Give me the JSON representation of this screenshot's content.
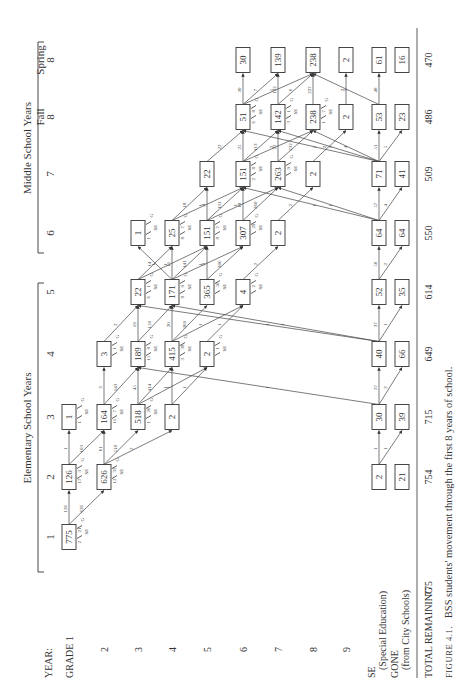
{
  "headers": {
    "year_label": "YEAR:",
    "elementary": "Elementary School Years",
    "middle": "Middle School Years",
    "years": [
      {
        "id": "y1",
        "label": "1"
      },
      {
        "id": "y2",
        "label": "2"
      },
      {
        "id": "y3",
        "label": "3"
      },
      {
        "id": "y4",
        "label": "4"
      },
      {
        "id": "y5",
        "label": "5"
      },
      {
        "id": "y6",
        "label": "6"
      },
      {
        "id": "y7",
        "label": "7"
      },
      {
        "id": "f8",
        "label": "8",
        "sub": "Fall"
      },
      {
        "id": "s8",
        "label": "8",
        "sub": "Spring"
      }
    ]
  },
  "rows": [
    {
      "id": "g1",
      "label": "GRADE 1"
    },
    {
      "id": "g2",
      "label": "2"
    },
    {
      "id": "g3",
      "label": "3"
    },
    {
      "id": "g4",
      "label": "4"
    },
    {
      "id": "g5",
      "label": "5"
    },
    {
      "id": "g6",
      "label": "6"
    },
    {
      "id": "g7",
      "label": "7"
    },
    {
      "id": "g8",
      "label": "8"
    },
    {
      "id": "g9",
      "label": "9"
    },
    {
      "id": "se",
      "label": "SE",
      "sub": "(Special Education)"
    },
    {
      "id": "gone",
      "label": "GONE",
      "sub": "(from City Schools)"
    }
  ],
  "totals": {
    "label": "TOTAL REMAINING",
    "values": [
      "775",
      "754",
      "715",
      "649",
      "614",
      "550",
      "509",
      "486",
      "470"
    ]
  },
  "caption": {
    "prefix": "FIGURE 4.1.",
    "text": "BSS students' movement through the first 8 years of school."
  },
  "boxes": [
    {
      "col": "y1",
      "row": "g1",
      "v": "775"
    },
    {
      "col": "y2",
      "row": "g1",
      "v": "126"
    },
    {
      "col": "y2",
      "row": "g2",
      "v": "626"
    },
    {
      "col": "y2",
      "row": "se",
      "v": "2"
    },
    {
      "col": "y2",
      "row": "gone",
      "v": "21"
    },
    {
      "col": "y3",
      "row": "g1",
      "v": "1"
    },
    {
      "col": "y3",
      "row": "g2",
      "v": "164"
    },
    {
      "col": "y3",
      "row": "g3",
      "v": "518"
    },
    {
      "col": "y3",
      "row": "g4",
      "v": "2"
    },
    {
      "col": "y3",
      "row": "se",
      "v": "30"
    },
    {
      "col": "y3",
      "row": "gone",
      "v": "39"
    },
    {
      "col": "y4",
      "row": "g2",
      "v": "3"
    },
    {
      "col": "y4",
      "row": "g3",
      "v": "189"
    },
    {
      "col": "y4",
      "row": "g4",
      "v": "415"
    },
    {
      "col": "y4",
      "row": "g5",
      "v": "2"
    },
    {
      "col": "y4",
      "row": "se",
      "v": "40"
    },
    {
      "col": "y4",
      "row": "gone",
      "v": "66"
    },
    {
      "col": "y5",
      "row": "g3",
      "v": "22"
    },
    {
      "col": "y5",
      "row": "g4",
      "v": "171"
    },
    {
      "col": "y5",
      "row": "g5",
      "v": "365"
    },
    {
      "col": "y5",
      "row": "g6",
      "v": "4"
    },
    {
      "col": "y5",
      "row": "se",
      "v": "52"
    },
    {
      "col": "y5",
      "row": "gone",
      "v": "35"
    },
    {
      "col": "y6",
      "row": "g3",
      "v": "1"
    },
    {
      "col": "y6",
      "row": "g4",
      "v": "25"
    },
    {
      "col": "y6",
      "row": "g5",
      "v": "151"
    },
    {
      "col": "y6",
      "row": "g6",
      "v": "307"
    },
    {
      "col": "y6",
      "row": "g7",
      "v": "2"
    },
    {
      "col": "y6",
      "row": "se",
      "v": "64"
    },
    {
      "col": "y6",
      "row": "gone",
      "v": "64"
    },
    {
      "col": "y7",
      "row": "g5",
      "v": "22"
    },
    {
      "col": "y7",
      "row": "g6",
      "v": "151"
    },
    {
      "col": "y7",
      "row": "g7",
      "v": "263"
    },
    {
      "col": "y7",
      "row": "g8",
      "v": "2"
    },
    {
      "col": "y7",
      "row": "se",
      "v": "71"
    },
    {
      "col": "y7",
      "row": "gone",
      "v": "41"
    },
    {
      "col": "f8",
      "row": "g6",
      "v": "51"
    },
    {
      "col": "f8",
      "row": "g7",
      "v": "142"
    },
    {
      "col": "f8",
      "row": "g8",
      "v": "238"
    },
    {
      "col": "f8",
      "row": "g9",
      "v": "2"
    },
    {
      "col": "f8",
      "row": "se",
      "v": "53"
    },
    {
      "col": "f8",
      "row": "gone",
      "v": "23"
    },
    {
      "col": "s8",
      "row": "g6",
      "v": "30"
    },
    {
      "col": "s8",
      "row": "g7",
      "v": "139"
    },
    {
      "col": "s8",
      "row": "g8",
      "v": "238"
    },
    {
      "col": "s8",
      "row": "g9",
      "v": "2"
    },
    {
      "col": "s8",
      "row": "se",
      "v": "61"
    },
    {
      "col": "s8",
      "row": "gone",
      "v": "16"
    }
  ],
  "flows": [
    {
      "from": [
        "y1",
        "g1"
      ],
      "to": [
        "y2",
        "g1"
      ],
      "v": "126"
    },
    {
      "from": [
        "y1",
        "g1"
      ],
      "to": [
        "y2",
        "g2"
      ],
      "v": "626"
    },
    {
      "from": [
        "y2",
        "g1"
      ],
      "to": [
        "y3",
        "g1"
      ],
      "v": "1"
    },
    {
      "from": [
        "y2",
        "g1"
      ],
      "to": [
        "y3",
        "g2"
      ],
      "v": "103"
    },
    {
      "from": [
        "y2",
        "g2"
      ],
      "to": [
        "y3",
        "g2"
      ],
      "v": "61"
    },
    {
      "from": [
        "y2",
        "g2"
      ],
      "to": [
        "y3",
        "g3"
      ],
      "v": "518"
    },
    {
      "from": [
        "y2",
        "g2"
      ],
      "to": [
        "y3",
        "g4"
      ],
      "v": "2"
    },
    {
      "from": [
        "y2",
        "se"
      ],
      "to": [
        "y3",
        "se"
      ],
      "v": "1"
    },
    {
      "from": [
        "y2",
        "se"
      ],
      "to": [
        "y3",
        "gone"
      ],
      "v": "1"
    },
    {
      "from": [
        "y3",
        "g2"
      ],
      "to": [
        "y4",
        "g2"
      ],
      "v": "3"
    },
    {
      "from": [
        "y3",
        "g2"
      ],
      "to": [
        "y4",
        "g3"
      ],
      "v": "143"
    },
    {
      "from": [
        "y3",
        "g3"
      ],
      "to": [
        "y4",
        "g3"
      ],
      "v": "45"
    },
    {
      "from": [
        "y3",
        "g3"
      ],
      "to": [
        "y4",
        "g4"
      ],
      "v": "414"
    },
    {
      "from": [
        "y3",
        "g3"
      ],
      "to": [
        "y4",
        "g5"
      ],
      "v": "1"
    },
    {
      "from": [
        "y3",
        "g4"
      ],
      "to": [
        "y4",
        "g4"
      ],
      "v": "1"
    },
    {
      "from": [
        "y3",
        "g4"
      ],
      "to": [
        "y4",
        "g5"
      ],
      "v": "1"
    },
    {
      "from": [
        "y3",
        "se"
      ],
      "to": [
        "y4",
        "g3"
      ],
      "v": "1"
    },
    {
      "from": [
        "y3",
        "se"
      ],
      "to": [
        "y4",
        "se"
      ],
      "v": "27"
    },
    {
      "from": [
        "y3",
        "se"
      ],
      "to": [
        "y4",
        "gone"
      ],
      "v": "2"
    },
    {
      "from": [
        "y4",
        "g2"
      ],
      "to": [
        "y5",
        "g3"
      ],
      "v": "2"
    },
    {
      "from": [
        "y4",
        "g3"
      ],
      "to": [
        "y5",
        "g3"
      ],
      "v": "19"
    },
    {
      "from": [
        "y4",
        "g3"
      ],
      "to": [
        "y5",
        "g4"
      ],
      "v": "150"
    },
    {
      "from": [
        "y4",
        "g4"
      ],
      "to": [
        "y5",
        "g4"
      ],
      "v": "20"
    },
    {
      "from": [
        "y4",
        "g4"
      ],
      "to": [
        "y5",
        "g5"
      ],
      "v": "360"
    },
    {
      "from": [
        "y4",
        "g4"
      ],
      "to": [
        "y5",
        "g6"
      ],
      "v": "1"
    },
    {
      "from": [
        "y4",
        "g5"
      ],
      "to": [
        "y5",
        "g6"
      ],
      "v": "1"
    },
    {
      "from": [
        "y4",
        "se"
      ],
      "to": [
        "y5",
        "g3"
      ],
      "v": "1"
    },
    {
      "from": [
        "y4",
        "se"
      ],
      "to": [
        "y5",
        "g4"
      ],
      "v": "1"
    },
    {
      "from": [
        "y4",
        "se"
      ],
      "to": [
        "y5",
        "se"
      ],
      "v": "37"
    },
    {
      "from": [
        "y4",
        "se"
      ],
      "to": [
        "y5",
        "gone"
      ],
      "v": "1"
    },
    {
      "from": [
        "y5",
        "g3"
      ],
      "to": [
        "y6",
        "g4"
      ],
      "v": "14"
    },
    {
      "from": [
        "y5",
        "g3"
      ],
      "to": [
        "y6",
        "g5"
      ],
      "v": "1"
    },
    {
      "from": [
        "y5",
        "g4"
      ],
      "to": [
        "y6",
        "g3"
      ],
      "v": "1"
    },
    {
      "from": [
        "y5",
        "g4"
      ],
      "to": [
        "y6",
        "g4"
      ],
      "v": "11"
    },
    {
      "from": [
        "y5",
        "g4"
      ],
      "to": [
        "y6",
        "g5"
      ],
      "v": "141"
    },
    {
      "from": [
        "y5",
        "g4"
      ],
      "to": [
        "y6",
        "g6"
      ],
      "v": "1"
    },
    {
      "from": [
        "y5",
        "g5"
      ],
      "to": [
        "y6",
        "g5"
      ],
      "v": "9"
    },
    {
      "from": [
        "y5",
        "g5"
      ],
      "to": [
        "y6",
        "g6"
      ],
      "v": "306"
    },
    {
      "from": [
        "y5",
        "g6"
      ],
      "to": [
        "y6",
        "g7"
      ],
      "v": "2"
    },
    {
      "from": [
        "y5",
        "se"
      ],
      "to": [
        "y6",
        "se"
      ],
      "v": "50"
    },
    {
      "from": [
        "y5",
        "se"
      ],
      "to": [
        "y6",
        "gone"
      ],
      "v": "2"
    },
    {
      "from": [
        "y6",
        "g4"
      ],
      "to": [
        "y7",
        "g5"
      ],
      "v": "18"
    },
    {
      "from": [
        "y6",
        "g4"
      ],
      "to": [
        "y7",
        "g6"
      ],
      "v": "1"
    },
    {
      "from": [
        "y6",
        "g5"
      ],
      "to": [
        "y7",
        "g5"
      ],
      "v": "4"
    },
    {
      "from": [
        "y6",
        "g5"
      ],
      "to": [
        "y7",
        "g6"
      ],
      "v": "131"
    },
    {
      "from": [
        "y6",
        "g5"
      ],
      "to": [
        "y7",
        "g7"
      ],
      "v": "1"
    },
    {
      "from": [
        "y6",
        "g6"
      ],
      "to": [
        "y7",
        "g6"
      ],
      "v": "18"
    },
    {
      "from": [
        "y6",
        "g6"
      ],
      "to": [
        "y7",
        "g7"
      ],
      "v": "260"
    },
    {
      "from": [
        "y6",
        "g7"
      ],
      "to": [
        "y7",
        "g8"
      ],
      "v": "2"
    },
    {
      "from": [
        "y6",
        "se"
      ],
      "to": [
        "y7",
        "g6"
      ],
      "v": "1"
    },
    {
      "from": [
        "y6",
        "se"
      ],
      "to": [
        "y7",
        "g7"
      ],
      "v": "1"
    },
    {
      "from": [
        "y6",
        "se"
      ],
      "to": [
        "y7",
        "se"
      ],
      "v": "57"
    },
    {
      "from": [
        "y6",
        "se"
      ],
      "to": [
        "y7",
        "gone"
      ],
      "v": "4"
    },
    {
      "from": [
        "y7",
        "g5"
      ],
      "to": [
        "f8",
        "g6"
      ],
      "v": "22"
    },
    {
      "from": [
        "y7",
        "g6"
      ],
      "to": [
        "f8",
        "g6"
      ],
      "v": "25"
    },
    {
      "from": [
        "y7",
        "g6"
      ],
      "to": [
        "f8",
        "g7"
      ],
      "v": "113"
    },
    {
      "from": [
        "y7",
        "g6"
      ],
      "to": [
        "f8",
        "g8"
      ],
      "v": "2"
    },
    {
      "from": [
        "y7",
        "g7"
      ],
      "to": [
        "f8",
        "g7"
      ],
      "v": "22"
    },
    {
      "from": [
        "y7",
        "g7"
      ],
      "to": [
        "f8",
        "g8"
      ],
      "v": "232"
    },
    {
      "from": [
        "y7",
        "g8"
      ],
      "to": [
        "f8",
        "g9"
      ],
      "v": "2"
    },
    {
      "from": [
        "y7",
        "se"
      ],
      "to": [
        "f8",
        "g6"
      ],
      "v": "1"
    },
    {
      "from": [
        "y7",
        "se"
      ],
      "to": [
        "f8",
        "g7"
      ],
      "v": "1"
    },
    {
      "from": [
        "y7",
        "se"
      ],
      "to": [
        "f8",
        "g8"
      ],
      "v": "4"
    },
    {
      "from": [
        "y7",
        "se"
      ],
      "to": [
        "f8",
        "se"
      ],
      "v": "51"
    },
    {
      "from": [
        "y7",
        "se"
      ],
      "to": [
        "f8",
        "gone"
      ],
      "v": "5"
    },
    {
      "from": [
        "f8",
        "g6"
      ],
      "to": [
        "s8",
        "g6"
      ],
      "v": "30"
    },
    {
      "from": [
        "f8",
        "g6"
      ],
      "to": [
        "s8",
        "g7"
      ],
      "v": "7"
    },
    {
      "from": [
        "f8",
        "g6"
      ],
      "to": [
        "s8",
        "g8"
      ],
      "v": "1"
    },
    {
      "from": [
        "f8",
        "g7"
      ],
      "to": [
        "s8",
        "g7"
      ],
      "v": "132"
    },
    {
      "from": [
        "f8",
        "g7"
      ],
      "to": [
        "s8",
        "g8"
      ],
      "v": "6"
    },
    {
      "from": [
        "f8",
        "g8"
      ],
      "to": [
        "s8",
        "g8"
      ],
      "v": "227"
    },
    {
      "from": [
        "f8",
        "g9"
      ],
      "to": [
        "s8",
        "g9"
      ],
      "v": "2"
    },
    {
      "from": [
        "f8",
        "se"
      ],
      "to": [
        "s8",
        "g8"
      ],
      "v": "5"
    },
    {
      "from": [
        "f8",
        "se"
      ],
      "to": [
        "s8",
        "se"
      ],
      "v": "48"
    }
  ],
  "exits": [
    {
      "col": "y1",
      "row": "g1",
      "se": "2",
      "g": "21"
    },
    {
      "col": "y2",
      "row": "g1",
      "se": "17",
      "g": "3"
    },
    {
      "col": "y2",
      "row": "g2",
      "se": "12",
      "g": "33"
    },
    {
      "col": "y3",
      "row": "g1",
      "se": "1",
      "g": ""
    },
    {
      "col": "y3",
      "row": "g2",
      "se": "11",
      "g": "7"
    },
    {
      "col": "y3",
      "row": "g3",
      "se": "1",
      "g": "20"
    },
    {
      "col": "y4",
      "row": "g2",
      "se": "",
      "g": "1"
    },
    {
      "col": "y4",
      "row": "g3",
      "se": "15",
      "g": "8"
    },
    {
      "col": "y4",
      "row": "g4",
      "se": "3",
      "g": "38"
    },
    {
      "col": "y4",
      "row": "g5",
      "se": "",
      "g": "1"
    },
    {
      "col": "y5",
      "row": "g3",
      "se": "6",
      "g": "1"
    },
    {
      "col": "y5",
      "row": "g4",
      "se": "8",
      "g": "9"
    },
    {
      "col": "y5",
      "row": "g5",
      "se": "",
      "g": "50"
    },
    {
      "col": "y5",
      "row": "g6",
      "se": "",
      "g": "2"
    },
    {
      "col": "y6",
      "row": "g3",
      "se": "1",
      "g": ""
    },
    {
      "col": "y6",
      "row": "g4",
      "se": "8",
      "g": "7"
    },
    {
      "col": "y6",
      "row": "g5",
      "se": "8",
      "g": "7"
    },
    {
      "col": "y6",
      "row": "g6",
      "se": "",
      "g": "29"
    },
    {
      "col": "y7",
      "row": "g6",
      "se": "2",
      "g": "8"
    },
    {
      "col": "y7",
      "row": "g7",
      "se": "",
      "g": "9"
    },
    {
      "col": "f8",
      "row": "g6",
      "se": "6",
      "g": "8"
    },
    {
      "col": "f8",
      "row": "g7",
      "se": "3",
      "g": "1"
    },
    {
      "col": "f8",
      "row": "g8",
      "se": "1",
      "g": "7"
    }
  ]
}
